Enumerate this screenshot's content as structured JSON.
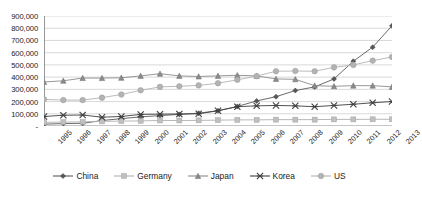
{
  "chart_data": {
    "type": "line",
    "title": "",
    "subtitle": "",
    "xlabel": "",
    "ylabel": "",
    "grid": true,
    "legend_position": "bottom",
    "ylim": [
      0,
      900000
    ],
    "ytick_values": [
      0,
      100000,
      200000,
      300000,
      400000,
      500000,
      600000,
      700000,
      800000,
      900000
    ],
    "ytick_labels": [
      "-",
      "100,000",
      "200,000",
      "300,000",
      "400,000",
      "500,000",
      "600,000",
      "700,000",
      "800,000",
      "900,000"
    ],
    "categories": [
      "1995",
      "1996",
      "1997",
      "1998",
      "1999",
      "2000",
      "2001",
      "2002",
      "2003",
      "2004",
      "2005",
      "2006",
      "2007",
      "2008",
      "2009",
      "2010",
      "2011",
      "2012",
      "2013"
    ],
    "series": [
      {
        "name": "China",
        "marker": "diamond",
        "color": "#595959",
        "values": [
          15000,
          20000,
          22000,
          45000,
          60000,
          75000,
          85000,
          95000,
          105000,
          125000,
          160000,
          205000,
          240000,
          290000,
          320000,
          385000,
          530000,
          645000,
          820000
        ]
      },
      {
        "name": "Germany",
        "marker": "square",
        "color": "#bfbfbf",
        "values": [
          30000,
          32000,
          34000,
          38000,
          40000,
          42000,
          45000,
          45000,
          46000,
          48000,
          50000,
          50000,
          52000,
          52000,
          52000,
          54000,
          54000,
          55000,
          55000
        ]
      },
      {
        "name": "Japan",
        "marker": "triangle",
        "color": "#8c8c8c",
        "values": [
          360000,
          370000,
          392000,
          392000,
          394000,
          410000,
          428000,
          410000,
          405000,
          410000,
          415000,
          410000,
          385000,
          382000,
          330000,
          325000,
          330000,
          330000,
          320000
        ]
      },
      {
        "name": "Korea",
        "marker": "x",
        "color": "#404040",
        "values": [
          78000,
          88000,
          90000,
          72000,
          78000,
          95000,
          97000,
          98000,
          100000,
          125000,
          158000,
          165000,
          168000,
          165000,
          158000,
          168000,
          178000,
          190000,
          200000
        ]
      },
      {
        "name": "US",
        "marker": "circle",
        "color": "#b3b3b3",
        "values": [
          218000,
          212000,
          212000,
          232000,
          258000,
          292000,
          320000,
          325000,
          332000,
          350000,
          378000,
          408000,
          448000,
          450000,
          448000,
          480000,
          500000,
          535000,
          565000
        ]
      }
    ]
  },
  "legend": {
    "items": [
      {
        "label": "China"
      },
      {
        "label": "Germany"
      },
      {
        "label": "Japan"
      },
      {
        "label": "Korea"
      },
      {
        "label": "US"
      }
    ]
  }
}
